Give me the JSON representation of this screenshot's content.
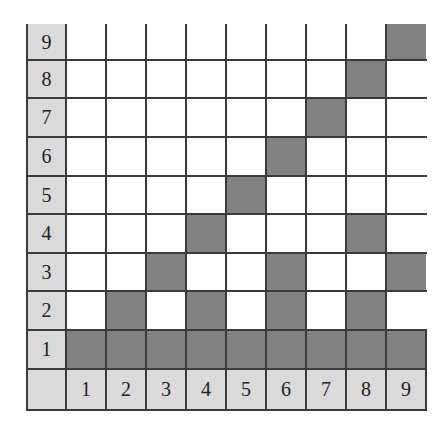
{
  "grid": {
    "size": 9,
    "row_labels": [
      "1",
      "2",
      "3",
      "4",
      "5",
      "6",
      "7",
      "8",
      "9"
    ],
    "col_labels": [
      "1",
      "2",
      "3",
      "4",
      "5",
      "6",
      "7",
      "8",
      "9"
    ],
    "shaded_cells": {
      "1": [
        1,
        2,
        3,
        4,
        5,
        6,
        7,
        8,
        9
      ],
      "2": [
        2,
        4,
        6,
        8
      ],
      "3": [
        3,
        6,
        9
      ],
      "4": [
        4,
        8
      ],
      "5": [
        5
      ],
      "6": [
        6
      ],
      "7": [
        7
      ],
      "8": [
        8
      ],
      "9": [
        9
      ]
    },
    "colors": {
      "shaded": "#828282",
      "label_bg": "#dadada",
      "line": "#3a3a3a",
      "background": "#ffffff"
    }
  }
}
